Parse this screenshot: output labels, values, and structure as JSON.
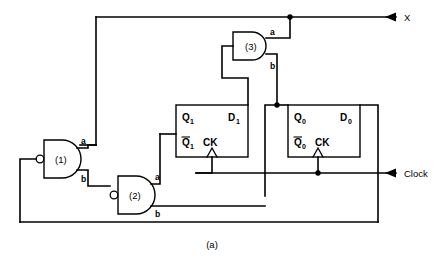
{
  "figure": {
    "caption": "(a)",
    "type": "digital-logic-circuit-diagram"
  },
  "io_ports": [
    {
      "name": "X",
      "label": "X",
      "direction": "output",
      "marker": "left-arrow"
    },
    {
      "name": "Clock",
      "label": "Clock",
      "direction": "input",
      "marker": "left-arrow"
    }
  ],
  "gates": [
    {
      "id": "gate-1",
      "label": "(1)",
      "shape": "nand",
      "inverted_input": true,
      "output_pins": [
        {
          "name": "a",
          "label": "a"
        },
        {
          "name": "b",
          "label": "b"
        }
      ]
    },
    {
      "id": "gate-2",
      "label": "(2)",
      "shape": "nand",
      "inverted_input": true,
      "output_pins": [
        {
          "name": "a",
          "label": "a"
        },
        {
          "name": "b",
          "label": "b"
        }
      ]
    },
    {
      "id": "gate-3",
      "label": "(3)",
      "shape": "and",
      "inverted_input": false,
      "output_pins": [
        {
          "name": "a",
          "label": "a"
        },
        {
          "name": "b",
          "label": "b"
        }
      ]
    }
  ],
  "flipflops": [
    {
      "id": "flipflop-1",
      "index": "1",
      "pins": {
        "q": "Q",
        "q_sub": "1",
        "d": "D",
        "d_sub": "1",
        "qbar": "Q",
        "qbar_sub": "1",
        "ck": "CK"
      }
    },
    {
      "id": "flipflop-0",
      "index": "0",
      "pins": {
        "q": "Q",
        "q_sub": "0",
        "d": "D",
        "d_sub": "0",
        "qbar": "Q",
        "qbar_sub": "0",
        "ck": "CK"
      }
    }
  ],
  "colors": {
    "wire": "#000000",
    "background": "#ffffff",
    "fill": "#ffffff"
  },
  "junctions": [
    {
      "name": "x-output-junction"
    },
    {
      "name": "q0-output-junction"
    },
    {
      "name": "clock-ck0-junction"
    }
  ]
}
